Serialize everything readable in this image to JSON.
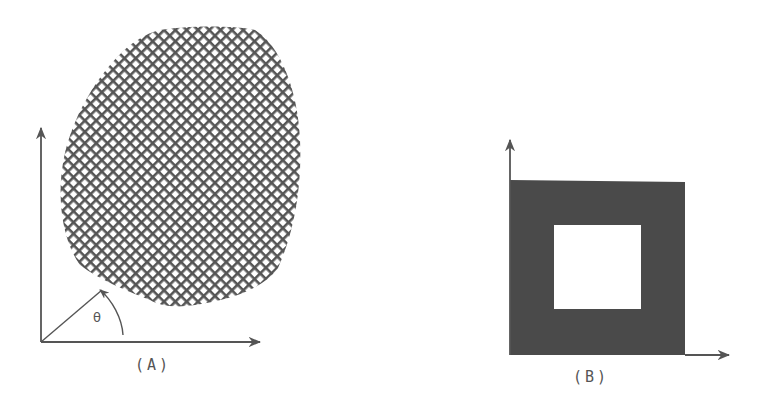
{
  "figure": {
    "panel_a": {
      "label": "(A)",
      "angle_label": "θ",
      "description": "Irregular convex region filled with crosshatch grid pattern, with x-y axes and angle θ measured from x-axis to a ray from origin",
      "region_fill": "crosshatch",
      "colors": {
        "ink": "#555555",
        "background": "#ffffff"
      }
    },
    "panel_b": {
      "label": "(B)",
      "description": "Solid filled square region with a square hole in the center, with x-y axes",
      "region_fill": "solid",
      "colors": {
        "fill": "#4a4a4a",
        "background": "#ffffff"
      }
    }
  }
}
